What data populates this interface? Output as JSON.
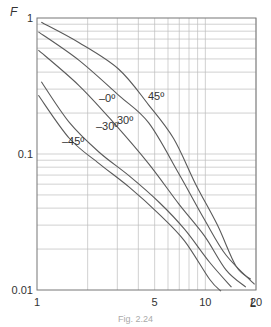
{
  "chart_data": {
    "type": "line",
    "title": "",
    "xlabel": "L",
    "ylabel": "F",
    "xscale": "log",
    "yscale": "log",
    "xlim": [
      1,
      20
    ],
    "ylim": [
      0.01,
      1
    ],
    "x_ticks": [
      {
        "value": 1,
        "label": "1"
      },
      {
        "value": 5,
        "label": "5"
      },
      {
        "value": 10,
        "label": "10"
      },
      {
        "value": 20,
        "label": "20"
      }
    ],
    "y_ticks": [
      {
        "value": 1,
        "label": "1"
      },
      {
        "value": 0.1,
        "label": "0.1"
      },
      {
        "value": 0.01,
        "label": "0.01"
      }
    ],
    "grid": true,
    "legend": "inline labels on curves",
    "series": [
      {
        "name": "45°",
        "label": "45º",
        "label_pos": [
          148,
          100
        ],
        "x": [
          1.06,
          1.77,
          3.06,
          4.6,
          6.48,
          8.76,
          11.8,
          15.2,
          18.6
        ],
        "y": [
          0.93,
          0.66,
          0.42,
          0.23,
          0.13,
          0.06,
          0.03,
          0.015,
          0.012
        ]
      },
      {
        "name": "30°",
        "label": "30º",
        "label_pos": [
          117,
          124
        ],
        "x": [
          1.02,
          1.77,
          3.06,
          4.6,
          6.95,
          9.88,
          13.3,
          19.6
        ],
        "y": [
          0.79,
          0.49,
          0.27,
          0.17,
          0.072,
          0.033,
          0.018,
          0.011
        ]
      },
      {
        "name": "0°",
        "label": "–0º",
        "label_pos": [
          99,
          102
        ],
        "x": [
          1.02,
          1.77,
          2.85,
          4.6,
          6.95,
          9.88,
          13.3,
          17.4
        ],
        "y": [
          0.58,
          0.32,
          0.17,
          0.085,
          0.043,
          0.025,
          0.014,
          0.0105
        ]
      },
      {
        "name": "-30°",
        "label": "–30º",
        "label_pos": [
          96,
          130
        ],
        "x": [
          1.06,
          1.56,
          2.34,
          3.53,
          5.33,
          7.52,
          10.6,
          14.3
        ],
        "y": [
          0.34,
          0.17,
          0.103,
          0.069,
          0.044,
          0.028,
          0.016,
          0.0105
        ]
      },
      {
        "name": "-45°",
        "label": "–45º",
        "label_pos": [
          62,
          145
        ],
        "x": [
          1.02,
          1.56,
          2.34,
          3.53,
          5.33,
          7.52,
          10.6,
          12.4
        ],
        "y": [
          0.27,
          0.13,
          0.085,
          0.057,
          0.036,
          0.023,
          0.012,
          0.0098
        ]
      }
    ]
  },
  "caption": "Fig. 2.24"
}
